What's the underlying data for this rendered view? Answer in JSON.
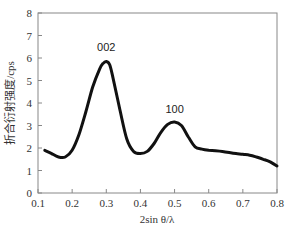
{
  "chart_data": {
    "type": "line",
    "title": "",
    "xlabel": "2sin θ/λ",
    "ylabel": "折合衍射强度/cps",
    "xlim": [
      0.1,
      0.8
    ],
    "ylim": [
      0,
      8
    ],
    "xticks": [
      "0.1",
      "0.2",
      "0.3",
      "0.4",
      "0.5",
      "0.6",
      "0.7",
      "0.8"
    ],
    "yticks": [
      "0",
      "1",
      "2",
      "3",
      "4",
      "5",
      "6",
      "7",
      "8"
    ],
    "grid": false,
    "legend": null,
    "series": [
      {
        "name": "diffraction",
        "x": [
          0.12,
          0.14,
          0.16,
          0.18,
          0.2,
          0.22,
          0.24,
          0.26,
          0.28,
          0.29,
          0.3,
          0.31,
          0.32,
          0.34,
          0.36,
          0.38,
          0.4,
          0.42,
          0.44,
          0.46,
          0.48,
          0.5,
          0.52,
          0.54,
          0.56,
          0.58,
          0.6,
          0.62,
          0.64,
          0.66,
          0.68,
          0.7,
          0.72,
          0.74,
          0.76,
          0.78,
          0.8
        ],
        "y": [
          1.9,
          1.75,
          1.6,
          1.6,
          1.9,
          2.6,
          3.6,
          4.7,
          5.5,
          5.75,
          5.85,
          5.7,
          5.1,
          3.7,
          2.4,
          1.85,
          1.75,
          1.85,
          2.2,
          2.7,
          3.05,
          3.15,
          3.0,
          2.5,
          2.05,
          1.95,
          1.9,
          1.88,
          1.85,
          1.8,
          1.75,
          1.72,
          1.68,
          1.6,
          1.5,
          1.38,
          1.2
        ]
      }
    ],
    "annotations": [
      {
        "text": "002",
        "x": 0.3,
        "y": 6.3
      },
      {
        "text": "100",
        "x": 0.5,
        "y": 3.55
      }
    ]
  }
}
